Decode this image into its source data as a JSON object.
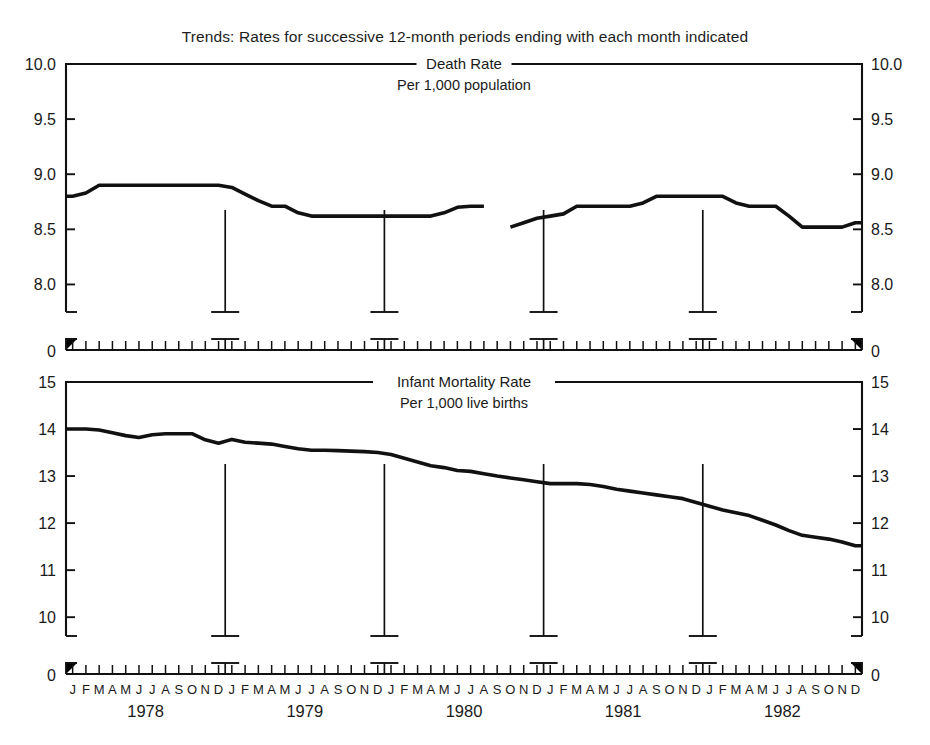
{
  "figure": {
    "suptitle": "Trends: Rates for successive 12-month periods ending with each month indicated",
    "background": "#ffffff",
    "line_color": "#111111",
    "axis_color": "#111111"
  },
  "chart_data": [
    {
      "type": "line",
      "title": "Death Rate",
      "subtitle": "Per 1,000  population",
      "xlabel": "",
      "ylabel": "",
      "ylim": [
        7.75,
        10.0
      ],
      "yticks": [
        8.0,
        8.5,
        9.0,
        9.5,
        10.0
      ],
      "ytick_labels": [
        "8.0",
        "8.5",
        "9.0",
        "9.5",
        "10.0"
      ],
      "axis_break_label": "0",
      "grid": false,
      "legend": "none",
      "months": [
        "J",
        "F",
        "M",
        "A",
        "M",
        "J",
        "J",
        "A",
        "S",
        "O",
        "N",
        "D"
      ],
      "years": [
        "1978",
        "1979",
        "1980",
        "1981",
        "1982"
      ],
      "x": [
        "1978-01",
        "1978-02",
        "1978-03",
        "1978-04",
        "1978-05",
        "1978-06",
        "1978-07",
        "1978-08",
        "1978-09",
        "1978-10",
        "1978-11",
        "1978-12",
        "1979-01",
        "1979-02",
        "1979-03",
        "1979-04",
        "1979-05",
        "1979-06",
        "1979-07",
        "1979-08",
        "1979-09",
        "1979-10",
        "1979-11",
        "1979-12",
        "1980-01",
        "1980-02",
        "1980-03",
        "1980-04",
        "1980-05",
        "1980-06",
        "1980-07",
        "1980-08",
        "1980-09",
        "1980-10",
        "1980-11",
        "1980-12",
        "1981-01",
        "1981-02",
        "1981-03",
        "1981-04",
        "1981-05",
        "1981-06",
        "1981-07",
        "1981-08",
        "1981-09",
        "1981-10",
        "1981-11",
        "1981-12",
        "1982-01",
        "1982-02",
        "1982-03",
        "1982-04",
        "1982-05",
        "1982-06",
        "1982-07",
        "1982-08",
        "1982-09",
        "1982-10",
        "1982-11",
        "1982-12"
      ],
      "values": [
        8.8,
        8.83,
        8.9,
        8.9,
        8.9,
        8.9,
        8.9,
        8.9,
        8.9,
        8.9,
        8.9,
        8.9,
        8.88,
        8.82,
        8.76,
        8.71,
        8.71,
        8.65,
        8.62,
        8.62,
        8.62,
        8.62,
        8.62,
        8.62,
        8.62,
        8.62,
        8.62,
        8.62,
        8.65,
        8.7,
        8.71,
        8.71,
        null,
        8.52,
        8.56,
        8.6,
        8.62,
        8.64,
        8.71,
        8.71,
        8.71,
        8.71,
        8.71,
        8.74,
        8.8,
        8.8,
        8.8,
        8.8,
        8.8,
        8.8,
        8.74,
        8.71,
        8.71,
        8.71,
        8.62,
        8.52,
        8.52,
        8.52,
        8.52,
        8.56
      ],
      "note": "series has a break between Sep 1980 and Oct 1980"
    },
    {
      "type": "line",
      "title": "Infant Mortality Rate",
      "subtitle": "Per 1,000  live births",
      "xlabel": "",
      "ylabel": "",
      "ylim": [
        9.6,
        15.0
      ],
      "yticks": [
        10,
        11,
        12,
        13,
        14,
        15
      ],
      "ytick_labels": [
        "10",
        "11",
        "12",
        "13",
        "14",
        "15"
      ],
      "axis_break_label": "0",
      "grid": false,
      "legend": "none",
      "months": [
        "J",
        "F",
        "M",
        "A",
        "M",
        "J",
        "J",
        "A",
        "S",
        "O",
        "N",
        "D"
      ],
      "years": [
        "1978",
        "1979",
        "1980",
        "1981",
        "1982"
      ],
      "x": [
        "1978-01",
        "1978-02",
        "1978-03",
        "1978-04",
        "1978-05",
        "1978-06",
        "1978-07",
        "1978-08",
        "1978-09",
        "1978-10",
        "1978-11",
        "1978-12",
        "1979-01",
        "1979-02",
        "1979-03",
        "1979-04",
        "1979-05",
        "1979-06",
        "1979-07",
        "1979-08",
        "1979-09",
        "1979-10",
        "1979-11",
        "1979-12",
        "1980-01",
        "1980-02",
        "1980-03",
        "1980-04",
        "1980-05",
        "1980-06",
        "1980-07",
        "1980-08",
        "1980-09",
        "1980-10",
        "1980-11",
        "1980-12",
        "1981-01",
        "1981-02",
        "1981-03",
        "1981-04",
        "1981-05",
        "1981-06",
        "1981-07",
        "1981-08",
        "1981-09",
        "1981-10",
        "1981-11",
        "1981-12",
        "1982-01",
        "1982-02",
        "1982-03",
        "1982-04",
        "1982-05",
        "1982-06",
        "1982-07",
        "1982-08",
        "1982-09",
        "1982-10",
        "1982-11",
        "1982-12"
      ],
      "values": [
        14.0,
        14.0,
        13.98,
        13.92,
        13.86,
        13.82,
        13.88,
        13.9,
        13.9,
        13.9,
        13.77,
        13.7,
        13.78,
        13.72,
        13.7,
        13.68,
        13.63,
        13.58,
        13.55,
        13.55,
        13.54,
        13.53,
        13.52,
        13.5,
        13.46,
        13.38,
        13.3,
        13.22,
        13.18,
        13.12,
        13.1,
        13.05,
        13.0,
        12.96,
        12.92,
        12.88,
        12.84,
        12.84,
        12.84,
        12.82,
        12.78,
        12.72,
        12.68,
        12.64,
        12.6,
        12.56,
        12.52,
        12.44,
        12.36,
        12.28,
        12.22,
        12.16,
        12.06,
        11.96,
        11.84,
        11.74,
        11.7,
        11.66,
        11.6,
        11.52
      ],
      "values_tail": [
        11.5,
        11.46,
        11.42,
        11.42,
        11.46,
        11.5
      ],
      "note": "continuous declining series, flattening near 11.4-11.5 at the end"
    }
  ]
}
